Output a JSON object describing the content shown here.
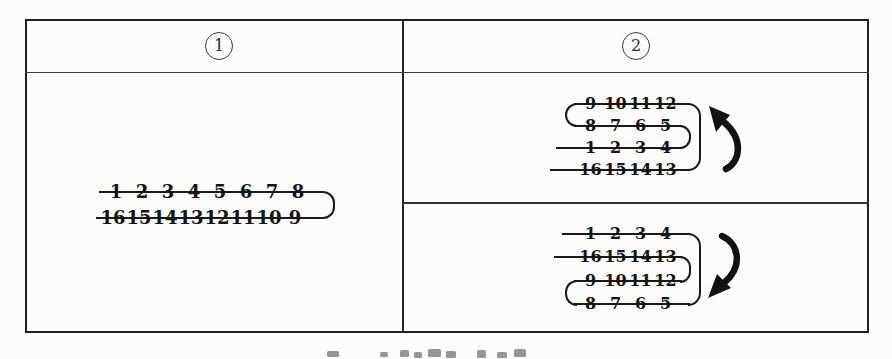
{
  "figure": {
    "header": {
      "col1": "1",
      "col2": "2"
    },
    "panel1": {
      "row1": [
        "1",
        "2",
        "3",
        "4",
        "5",
        "6",
        "7",
        "8"
      ],
      "row2": [
        "16",
        "15",
        "14",
        "13",
        "12",
        "11",
        "10",
        "9"
      ]
    },
    "panel2_top": {
      "row1": [
        "9",
        "10",
        "11",
        "12"
      ],
      "row2": [
        "8",
        "7",
        "6",
        "5"
      ],
      "row3": [
        "1",
        "2",
        "3",
        "4"
      ],
      "row4": [
        "16",
        "15",
        "14",
        "13"
      ],
      "arrow_direction": "counterclockwise-up"
    },
    "panel2_bottom": {
      "row1": [
        "1",
        "2",
        "3",
        "4"
      ],
      "row2": [
        "16",
        "15",
        "14",
        "13"
      ],
      "row3": [
        "9",
        "10",
        "11",
        "12"
      ],
      "row4": [
        "8",
        "7",
        "6",
        "5"
      ],
      "arrow_direction": "clockwise-down"
    },
    "colors": {
      "ink": "#1a1a1a",
      "border": "#222222",
      "background": "#fcfcfb"
    }
  }
}
